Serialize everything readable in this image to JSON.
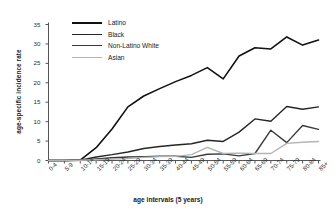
{
  "chart_data": {
    "type": "line",
    "title": "",
    "xlabel": "age intervals (5 years)",
    "ylabel": "age-specific incidence rate",
    "categories": [
      "0-4",
      "5-9",
      "10-14",
      "15-19",
      "20-24",
      "25-29",
      "30-34",
      "35-39",
      "40-44",
      "45-49",
      "50-54",
      "55-59",
      "60-64",
      "65-69",
      "70-74",
      "75-79",
      "80-84",
      "85+"
    ],
    "ylim": [
      0,
      35
    ],
    "yticks": [
      0,
      5,
      10,
      15,
      20,
      25,
      30,
      35
    ],
    "grid": false,
    "legend_position": "top-left",
    "series": [
      {
        "name": "Latino",
        "color": "#111111",
        "width": 1.6,
        "values": [
          0,
          0,
          0.1,
          3.3,
          8.1,
          13.8,
          16.6,
          18.5,
          20.3,
          21.9,
          23.9,
          21.0,
          26.9,
          29.0,
          28.7,
          31.8,
          29.7,
          31.0
        ]
      },
      {
        "name": "Black",
        "color": "#262626",
        "width": 1.4,
        "values": [
          0,
          0,
          0.1,
          0.9,
          1.5,
          2.2,
          3.1,
          3.6,
          4.0,
          4.3,
          5.2,
          4.9,
          7.3,
          10.7,
          10.1,
          13.9,
          13.2,
          13.8
        ]
      },
      {
        "name": "Non-Latino White",
        "color": "#3a3a3a",
        "width": 1.4,
        "values": [
          0,
          0,
          0.05,
          0.4,
          0.7,
          0.9,
          1.0,
          1.1,
          1.1,
          0.8,
          1.6,
          1.7,
          1.2,
          1.8,
          7.8,
          4.6,
          9.0,
          8.0
        ]
      },
      {
        "name": "Asian",
        "color": "#b4b4b4",
        "width": 1.4,
        "values": [
          0,
          0,
          0.05,
          0.2,
          0.35,
          0.5,
          0.8,
          1.0,
          1.05,
          1.5,
          3.4,
          1.8,
          1.9,
          1.8,
          1.8,
          4.4,
          4.7,
          4.9
        ]
      }
    ]
  },
  "legend": {
    "items": [
      {
        "label": "Latino"
      },
      {
        "label": "Black"
      },
      {
        "label": "Non-Latino White"
      },
      {
        "label": "Asian"
      }
    ]
  }
}
